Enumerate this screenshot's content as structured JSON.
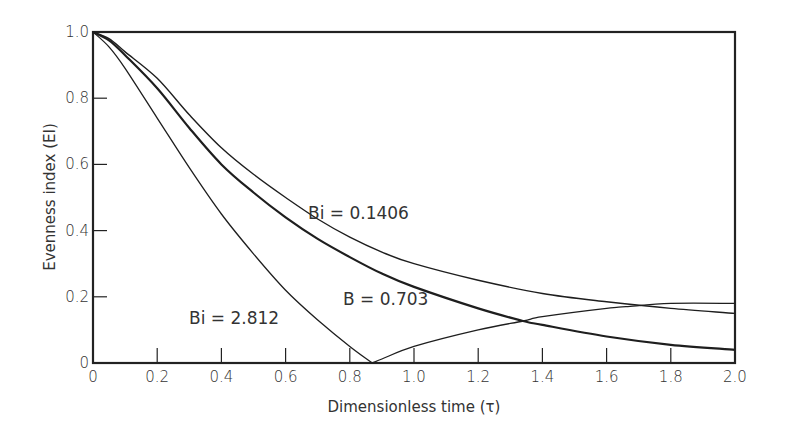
{
  "chart_data": {
    "type": "line",
    "title": "",
    "xlabel": "Dimensionless time (τ)",
    "ylabel": "Evenness index (EI)",
    "xlim": [
      0,
      2.0
    ],
    "ylim": [
      0,
      1.0
    ],
    "grid": false,
    "legend_position": "inline annotations",
    "x_ticks": [
      "0",
      "0.2",
      "0.4",
      "0.6",
      "0.8",
      "1.0",
      "1.2",
      "1.4",
      "1.6",
      "1.8",
      "2.0"
    ],
    "y_ticks": [
      "0",
      "0.2",
      "0.4",
      "0.6",
      "0.8",
      "1.0"
    ],
    "series": [
      {
        "name": "Bi = 0.1406",
        "x": [
          0,
          0.05,
          0.1,
          0.2,
          0.3,
          0.4,
          0.5,
          0.6,
          0.7,
          0.8,
          0.9,
          1.0,
          1.2,
          1.4,
          1.6,
          1.8,
          2.0
        ],
        "values": [
          1.0,
          0.98,
          0.94,
          0.86,
          0.75,
          0.65,
          0.57,
          0.5,
          0.435,
          0.38,
          0.335,
          0.3,
          0.25,
          0.21,
          0.185,
          0.165,
          0.15
        ]
      },
      {
        "name": "B = 0.703",
        "x": [
          0,
          0.05,
          0.1,
          0.2,
          0.3,
          0.4,
          0.5,
          0.6,
          0.7,
          0.8,
          0.9,
          1.0,
          1.2,
          1.34,
          1.4,
          1.6,
          1.8,
          2.0
        ],
        "values": [
          1.0,
          0.975,
          0.93,
          0.83,
          0.71,
          0.6,
          0.515,
          0.44,
          0.375,
          0.32,
          0.27,
          0.23,
          0.165,
          0.127,
          0.115,
          0.08,
          0.055,
          0.04
        ]
      },
      {
        "name": "Bi = 2.812",
        "x": [
          0,
          0.05,
          0.1,
          0.2,
          0.3,
          0.4,
          0.5,
          0.6,
          0.7,
          0.8,
          0.87,
          0.9,
          1.0,
          1.2,
          1.34,
          1.4,
          1.6,
          1.66,
          1.8,
          2.0
        ],
        "values": [
          1.0,
          0.955,
          0.89,
          0.74,
          0.59,
          0.45,
          0.33,
          0.22,
          0.13,
          0.05,
          0.0,
          0.012,
          0.05,
          0.1,
          0.127,
          0.14,
          0.165,
          0.17,
          0.18,
          0.18
        ]
      }
    ],
    "annotations": [
      {
        "text": "Bi = 0.1406",
        "x": 0.98,
        "y": 0.45
      },
      {
        "text": "B = 0.703",
        "x": 1.18,
        "y": 0.19
      },
      {
        "text": "Bi = 2.812",
        "x": 0.36,
        "y": 0.14
      }
    ]
  },
  "labels": {
    "xlabel": "Dimensionless time (τ)",
    "ylabel": "Evenness index (EI)",
    "anno_top": "Bi = 0.1406",
    "anno_mid": "B = 0.703",
    "anno_low": "Bi = 2.812"
  }
}
